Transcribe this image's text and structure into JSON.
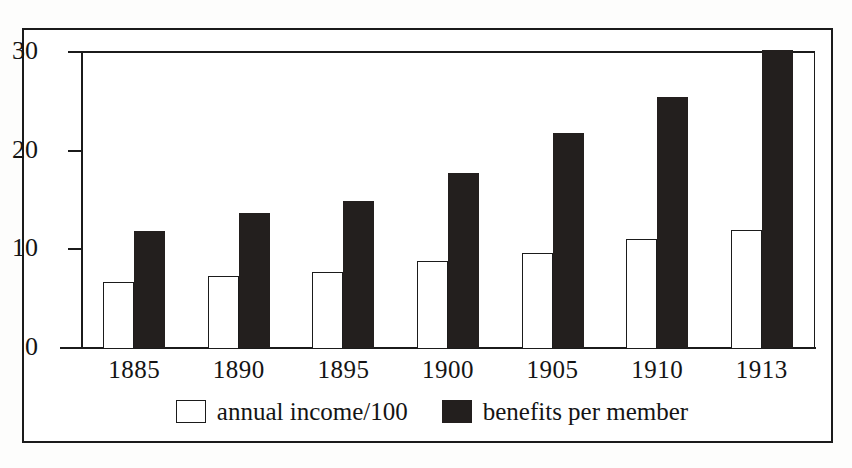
{
  "chart_data": {
    "type": "bar",
    "title": "",
    "subtitle": "",
    "xlabel": "",
    "ylabel": "",
    "categories": [
      "1885",
      "1890",
      "1895",
      "1900",
      "1905",
      "1910",
      "1913"
    ],
    "series": [
      {
        "name": "annual income/100",
        "swatch": "light",
        "values": [
          6.7,
          7.3,
          7.7,
          8.8,
          9.6,
          11.0,
          12.0
        ]
      },
      {
        "name": "benefits per member",
        "swatch": "dark",
        "values": [
          11.9,
          13.7,
          14.9,
          17.7,
          21.8,
          25.4,
          30.2
        ]
      }
    ],
    "ylim": [
      0,
      30
    ],
    "yticks": [
      0,
      10,
      20,
      30
    ],
    "ytick_labels": [
      "0",
      "10",
      "20",
      "30"
    ],
    "grid": false,
    "legend_position": "bottom-center",
    "bar_style": "grouped-adjacent",
    "colors": {
      "light_fill": "#ffffff",
      "dark_fill": "#231f1e",
      "axis": "#1b1b1b",
      "text": "#141414",
      "background": "#ffffff"
    }
  },
  "axes": {
    "y_ticks": [
      {
        "label": "30",
        "value": 30
      },
      {
        "label": "20",
        "value": 20
      },
      {
        "label": "10",
        "value": 10
      },
      {
        "label": "0",
        "value": 0
      }
    ],
    "x_ticks": [
      {
        "label": "1885"
      },
      {
        "label": "1890"
      },
      {
        "label": "1895"
      },
      {
        "label": "1900"
      },
      {
        "label": "1905"
      },
      {
        "label": "1910"
      },
      {
        "label": "1913"
      }
    ]
  },
  "legend": {
    "entries": [
      {
        "label": "annual income/100",
        "swatch": "light"
      },
      {
        "label": "benefits per member",
        "swatch": "dark"
      }
    ]
  }
}
